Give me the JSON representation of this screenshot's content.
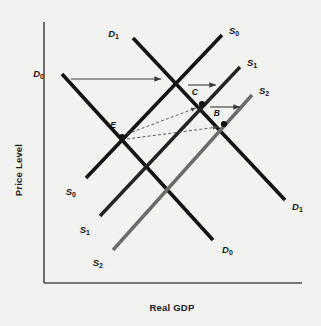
{
  "figure": {
    "background_color": "#f2f2f1",
    "width": 321,
    "height": 326
  },
  "axes": {
    "color": "#4a4a4a",
    "y_label": "Price Level",
    "x_label": "Real GDP",
    "origin": [
      44,
      283
    ],
    "y_top": [
      44,
      22
    ],
    "x_right": [
      302,
      283
    ]
  },
  "chart_data": {
    "type": "line",
    "title": "",
    "xlabel": "Real GDP",
    "ylabel": "Price Level",
    "grid": false,
    "legend": "none",
    "axis_ticks": "none",
    "curves": [
      {
        "id": "D0",
        "name": "D0",
        "label": "D",
        "subscript": "0",
        "kind": "demand",
        "slope": "downward",
        "color": "#141414",
        "width": 3.6,
        "x1": 62,
        "y1": 74,
        "x2": 213,
        "y2": 240,
        "label_start": {
          "x": 44,
          "y": 74,
          "anchor": "end"
        },
        "label_end": {
          "x": 222,
          "y": 250,
          "anchor": "start"
        }
      },
      {
        "id": "D1",
        "name": "D1",
        "label": "D",
        "subscript": "1",
        "kind": "demand",
        "slope": "downward",
        "color": "#141414",
        "width": 3.6,
        "x1": 133,
        "y1": 38,
        "x2": 285,
        "y2": 200,
        "label_start": {
          "x": 119,
          "y": 34,
          "anchor": "end"
        },
        "label_end": {
          "x": 292,
          "y": 207,
          "anchor": "start"
        }
      },
      {
        "id": "S0",
        "name": "S0",
        "label": "S",
        "subscript": "0",
        "kind": "supply",
        "slope": "upward",
        "color": "#141414",
        "width": 3.6,
        "x1": 86,
        "y1": 178,
        "x2": 222,
        "y2": 35,
        "label_start": {
          "x": 76,
          "y": 192,
          "anchor": "end"
        },
        "label_end": {
          "x": 229,
          "y": 31,
          "anchor": "start"
        }
      },
      {
        "id": "S1",
        "name": "S1",
        "label": "S",
        "subscript": "1",
        "kind": "supply",
        "slope": "upward",
        "color": "#232323",
        "width": 3.4,
        "x1": 100,
        "y1": 216,
        "x2": 240,
        "y2": 67,
        "label_start": {
          "x": 90,
          "y": 230,
          "anchor": "end"
        },
        "label_end": {
          "x": 247,
          "y": 63,
          "anchor": "start"
        }
      },
      {
        "id": "S2",
        "name": "S2",
        "label": "S",
        "subscript": "2",
        "kind": "supply",
        "slope": "upward",
        "color": "#6b6b6b",
        "width": 3.4,
        "x1": 113,
        "y1": 250,
        "x2": 252,
        "y2": 95,
        "label_start": {
          "x": 103,
          "y": 263,
          "anchor": "end"
        },
        "label_end": {
          "x": 259,
          "y": 91,
          "anchor": "start"
        }
      }
    ],
    "points": [
      {
        "id": "E",
        "label": "E",
        "x": 122,
        "y": 137,
        "label_x": 116,
        "label_y": 128,
        "color": "#141414"
      },
      {
        "id": "C",
        "label": "C",
        "x": 202,
        "y": 104,
        "label_x": 198,
        "label_y": 95,
        "color": "#141414"
      },
      {
        "id": "B",
        "label": "B",
        "x": 224,
        "y": 124,
        "label_x": 220,
        "label_y": 116,
        "color": "#141414"
      }
    ],
    "shift_arrows": [
      {
        "id": "ad-shift",
        "name": "demand-shift-arrow",
        "x1": 71,
        "y1": 79,
        "x2": 161,
        "y2": 79,
        "color": "#3a3a3a",
        "style": "solid"
      },
      {
        "id": "as-shift-1",
        "name": "supply-shift-arrow-1",
        "x1": 188,
        "y1": 85,
        "x2": 216,
        "y2": 85,
        "color": "#3a3a3a",
        "style": "solid"
      },
      {
        "id": "as-shift-2",
        "name": "supply-shift-arrow-2",
        "x1": 210,
        "y1": 107,
        "x2": 240,
        "y2": 107,
        "color": "#3a3a3a",
        "style": "solid"
      }
    ],
    "movement_arrows": [
      {
        "id": "E-to-C",
        "name": "equilibrium-path-e-to-c",
        "x1": 127,
        "y1": 134,
        "x2": 196,
        "y2": 108,
        "color": "#4a4a4a",
        "style": "dashed"
      },
      {
        "id": "E-to-B",
        "name": "equilibrium-path-e-to-b",
        "x1": 127,
        "y1": 139,
        "x2": 218,
        "y2": 127,
        "color": "#4a4a4a",
        "style": "dashed"
      }
    ]
  }
}
